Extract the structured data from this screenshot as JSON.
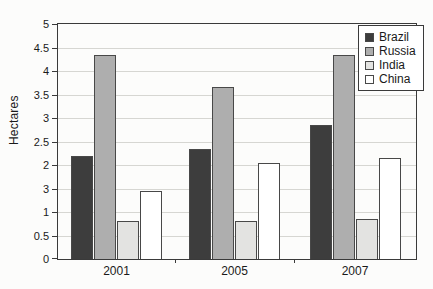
{
  "chart_data": {
    "type": "bar",
    "title": "",
    "xlabel": "",
    "ylabel": "Hectares",
    "ylim": [
      0,
      5
    ],
    "ytick_step": 0.5,
    "grid": "horizontal",
    "legend_position": "top-right",
    "categories": [
      "2001",
      "2005",
      "2007"
    ],
    "series": [
      {
        "name": "Brazil",
        "color": "#3d3d3d",
        "values": [
          2.2,
          2.35,
          2.85
        ]
      },
      {
        "name": "Russia",
        "color": "#aeaeae",
        "values": [
          4.35,
          3.65,
          4.35
        ]
      },
      {
        "name": "India",
        "color": "#e3e3e1",
        "values": [
          0.8,
          0.8,
          0.85
        ]
      },
      {
        "name": "China",
        "color": "#ffffff",
        "values": [
          1.45,
          2.05,
          2.15
        ]
      }
    ],
    "yticks": [
      {
        "v": 5,
        "label": "5"
      },
      {
        "v": 4.5,
        "label": "4.5"
      },
      {
        "v": 4,
        "label": "4"
      },
      {
        "v": 3.5,
        "label": "3.5"
      },
      {
        "v": 3,
        "label": "3"
      },
      {
        "v": 2.5,
        "label": "2.5"
      },
      {
        "v": 2,
        "label": "2"
      },
      {
        "v": 1.5,
        "label": "3"
      },
      {
        "v": 1,
        "label": "1"
      },
      {
        "v": 0.5,
        "label": "0.5"
      },
      {
        "v": 0,
        "label": "0"
      }
    ],
    "colors": {
      "plot_border": "#3a3a3a",
      "gridline": "#d6d6d2",
      "bar_border": "#484848",
      "text": "#1a1a1a",
      "background": "#fcfcfb"
    }
  }
}
